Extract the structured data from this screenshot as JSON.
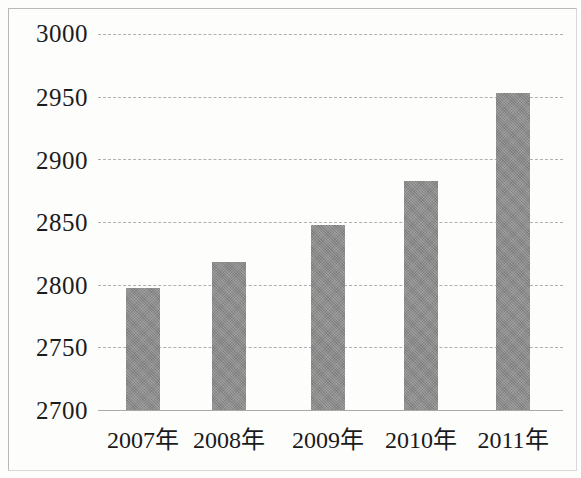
{
  "chart_data": {
    "type": "bar",
    "title": "",
    "subtitle": "",
    "xlabel": "",
    "ylabel": "",
    "categories": [
      "2007年",
      "2008年",
      "2009年",
      "2010年",
      "2011年"
    ],
    "values": [
      2797,
      2818,
      2848,
      2883,
      2953
    ],
    "ylim": [
      2700,
      3000
    ],
    "ytick_labels": [
      "3000",
      "2950",
      "2900",
      "2850",
      "2800",
      "2750",
      "2700"
    ],
    "yticks": [
      3000,
      2950,
      2900,
      2850,
      2800,
      2750,
      2700
    ],
    "grid": true,
    "grid_style": "dashed-horizontal",
    "legend": null,
    "bar_color": "#8a8a8a",
    "gridline_color": "#b0b0b0",
    "axis_color": "#a9a9a9",
    "frame_color": "#b9b9b9",
    "background": "#fdfdfc"
  }
}
